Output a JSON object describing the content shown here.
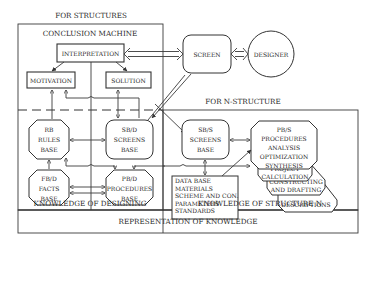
{
  "title_top": "FOR STRUCTURES",
  "conclusion_machine": {
    "title": "CONCLUSION MACHINE",
    "interpretation": "INTERPRETATION",
    "motivation": "MOTIVATION",
    "solution": "SOLUTION"
  },
  "screen": "SCREEN",
  "designer": "DESIGNER",
  "n_structure_title": "FOR N-STRUCTURE",
  "designing": {
    "rb": [
      "RB",
      "RULES",
      "BASE"
    ],
    "sbd": [
      "SB/D",
      "SCREENS",
      "BASE"
    ],
    "fbd": [
      "FB/D",
      "FACTS",
      "BASE"
    ],
    "pbd": [
      "PB/D",
      "PROCEDURES",
      "BASE"
    ],
    "label": "KNOWLEDGE OF DESIGNING"
  },
  "structure": {
    "sbs": [
      "SB/S",
      "SCREENS",
      "BASE"
    ],
    "pbs": [
      "PB/S",
      "PROCEDURES",
      "ANALYSIS",
      "OPTIMIZATION",
      "SYNTHESIS"
    ],
    "project": [
      "PROJECT",
      "CALCULATION"
    ],
    "constructing": [
      "CONSTRUCTING",
      "AND DRAFTING"
    ],
    "descriptions": "DESCRIPTIONS",
    "database": [
      "DATA BASE",
      "MATERIALS",
      "SCHEME AND CON.",
      "PARAMETERS",
      "STANDARDS"
    ],
    "label": "KNOWLEDGE OF STRUCTURE N"
  },
  "footer": "REPRESENTATION OF KNOWLEDGE"
}
